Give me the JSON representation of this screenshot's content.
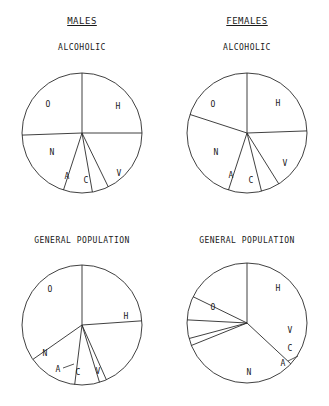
{
  "figure": {
    "width": 329,
    "height": 406,
    "background": "#ffffff",
    "ink": "#2b2b2b"
  },
  "column_headers": [
    {
      "label": "MALES",
      "x": 82,
      "y": 22
    },
    {
      "label": "FEMALES",
      "x": 247,
      "y": 22
    }
  ],
  "chart_data": [
    {
      "type": "pie",
      "title": "ALCOHOLIC",
      "group": "MALES",
      "panel": "top-left",
      "title_x": 82,
      "title_y": 48,
      "cx": 82,
      "cy": 133,
      "r": 60,
      "start_angle_deg": 0,
      "direction": "counterclockwise",
      "categories": [
        "O",
        "N",
        "A",
        "C",
        "V",
        "H"
      ],
      "values": [
        25.0,
        18.0,
        4.5,
        8.0,
        19.5,
        25.0
      ],
      "slices": [
        {
          "label": "O",
          "start_deg": 0,
          "end_deg": 90,
          "label_x": 48,
          "label_y": 104
        },
        {
          "label": "N",
          "start_deg": 90,
          "end_deg": 154,
          "label_x": 52,
          "label_y": 152
        },
        {
          "label": "A",
          "start_deg": 154,
          "end_deg": 170,
          "label_x": 67,
          "label_y": 176
        },
        {
          "label": "C",
          "start_deg": 170,
          "end_deg": 198,
          "label_x": 86,
          "label_y": 180
        },
        {
          "label": "V",
          "start_deg": 198,
          "end_deg": 268,
          "label_x": 119,
          "label_y": 173
        },
        {
          "label": "H",
          "start_deg": 268,
          "end_deg": 360,
          "label_x": 118,
          "label_y": 106
        }
      ],
      "leaders": []
    },
    {
      "type": "pie",
      "title": "ALCOHOLIC",
      "group": "FEMALES",
      "panel": "top-right",
      "title_x": 247,
      "title_y": 48,
      "cx": 247,
      "cy": 133,
      "r": 60,
      "start_angle_deg": 0,
      "direction": "counterclockwise",
      "categories": [
        "O",
        "N",
        "A",
        "C",
        "V",
        "H"
      ],
      "values": [
        24.5,
        16.5,
        5.0,
        9.0,
        25.0,
        20.0
      ],
      "slices": [
        {
          "label": "O",
          "start_deg": 0,
          "end_deg": 88,
          "label_x": 213,
          "label_y": 104
        },
        {
          "label": "N",
          "start_deg": 88,
          "end_deg": 148,
          "label_x": 216,
          "label_y": 152
        },
        {
          "label": "A",
          "start_deg": 148,
          "end_deg": 166,
          "label_x": 231,
          "label_y": 175
        },
        {
          "label": "C",
          "start_deg": 166,
          "end_deg": 198,
          "label_x": 251,
          "label_y": 180
        },
        {
          "label": "V",
          "start_deg": 198,
          "end_deg": 288,
          "label_x": 285,
          "label_y": 163
        },
        {
          "label": "H",
          "start_deg": 288,
          "end_deg": 360,
          "label_x": 278,
          "label_y": 103
        }
      ],
      "leaders": []
    },
    {
      "type": "pie",
      "title": "GENERAL POPULATION",
      "group": "MALES",
      "panel": "bottom-left",
      "title_x": 82,
      "title_y": 241,
      "cx": 82,
      "cy": 325,
      "r": 60,
      "start_angle_deg": 0,
      "direction": "counterclockwise",
      "categories": [
        "O",
        "N",
        "A",
        "C",
        "V",
        "H"
      ],
      "values": [
        24.0,
        19.5,
        2.0,
        6.5,
        13.5,
        34.5
      ],
      "slices": [
        {
          "label": "O",
          "start_deg": 0,
          "end_deg": 86,
          "label_x": 50,
          "label_y": 289
        },
        {
          "label": "N",
          "start_deg": 86,
          "end_deg": 156,
          "label_x": 45,
          "label_y": 353
        },
        {
          "label": "A",
          "start_deg": 156,
          "end_deg": 163,
          "label_x": 58,
          "label_y": 369
        },
        {
          "label": "C",
          "start_deg": 163,
          "end_deg": 187,
          "label_x": 78,
          "label_y": 372
        },
        {
          "label": "V",
          "start_deg": 187,
          "end_deg": 235,
          "label_x": 98,
          "label_y": 371
        },
        {
          "label": "H",
          "start_deg": 235,
          "end_deg": 352,
          "label_x": 126,
          "label_y": 316
        }
      ],
      "leaders": [
        {
          "x1": 63,
          "y1": 368,
          "x2": 74,
          "y2": 364
        }
      ]
    },
    {
      "type": "pie",
      "title": "GENERAL POPULATION",
      "group": "FEMALES",
      "panel": "bottom-right",
      "title_x": 247,
      "title_y": 241,
      "cx": 247,
      "cy": 323,
      "r": 60,
      "start_angle_deg": 0,
      "direction": "counterclockwise",
      "categories": [
        "O",
        "N",
        "A",
        "C",
        "V",
        "H"
      ],
      "values": [
        37.0,
        32.0,
        2.0,
        5.0,
        6.5,
        17.5
      ],
      "slices": [
        {
          "label": "O",
          "start_deg": 0,
          "end_deg": 133,
          "label_x": 213,
          "label_y": 307
        },
        {
          "label": "N",
          "start_deg": 133,
          "end_deg": 248,
          "label_x": 249,
          "label_y": 372
        },
        {
          "label": "A",
          "start_deg": 248,
          "end_deg": 255,
          "label_x": 283,
          "label_y": 363
        },
        {
          "label": "C",
          "start_deg": 255,
          "end_deg": 273,
          "label_x": 290,
          "label_y": 348
        },
        {
          "label": "V",
          "start_deg": 273,
          "end_deg": 296,
          "label_x": 290,
          "label_y": 330
        },
        {
          "label": "H",
          "start_deg": 296,
          "end_deg": 360,
          "label_x": 278,
          "label_y": 288
        }
      ],
      "leaders": [
        {
          "x1": 288,
          "y1": 361,
          "x2": 298,
          "y2": 356
        }
      ]
    }
  ]
}
